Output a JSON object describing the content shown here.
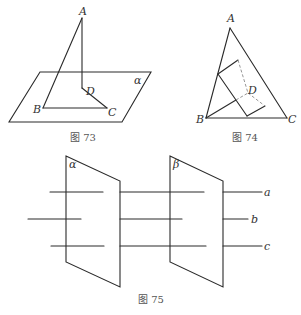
{
  "figures": [
    {
      "id": "fig73",
      "caption": "图 73",
      "labels": {
        "A": "A",
        "B": "B",
        "C": "C",
        "D": "D",
        "plane": "α"
      }
    },
    {
      "id": "fig74",
      "caption": "图 74",
      "labels": {
        "A": "A",
        "B": "B",
        "C": "C",
        "D": "D"
      }
    },
    {
      "id": "fig75",
      "caption": "图 75",
      "labels": {
        "plane1": "α",
        "plane2": "β",
        "line_a": "a",
        "line_b": "b",
        "line_c": "c"
      }
    }
  ],
  "colors": {
    "line": "#2a2a2a",
    "dashed": "#8a8a8a",
    "background": "#ffffff"
  }
}
